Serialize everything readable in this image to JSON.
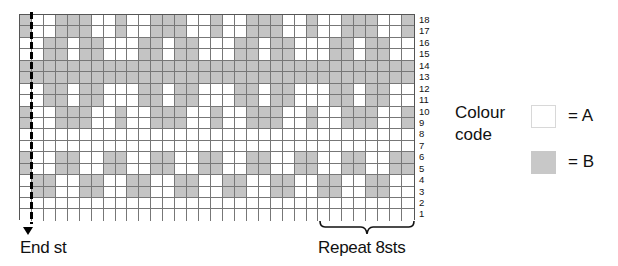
{
  "chart_data": {
    "type": "table",
    "columns": 33,
    "rows_count": 18,
    "colors": {
      "A": "#ffffff",
      "B": "#c4c4c4"
    },
    "rows": [
      {
        "row": 18,
        "cells": "BAABBBAABAABBBAABAABBBAABAABBBAAB"
      },
      {
        "row": 17,
        "cells": "BAABBBAABAABBBAABAABBBAABAABBBAAB"
      },
      {
        "row": 16,
        "cells": "AABBABBAAABBABBAAABBABBAAABBABBAA"
      },
      {
        "row": 15,
        "cells": "AABBABBAAABBABBAAABBABBAAABBABBAA"
      },
      {
        "row": 14,
        "cells": "BBBBBBBBBBBBBBBBBBBBBBBBBBBBBBBBB"
      },
      {
        "row": 13,
        "cells": "BBBBBBBBBBBBBBBBBBBBBBBBBBBBBBBBB"
      },
      {
        "row": 12,
        "cells": "AABBABBAAABBABBAAABBABBAAABBABBAA"
      },
      {
        "row": 11,
        "cells": "AABBABBAAABBABBAAABBABBAAABBABBAA"
      },
      {
        "row": 10,
        "cells": "BAABBBAABAABBBAABAABBBAABAABBBAAB"
      },
      {
        "row": 9,
        "cells": "BAABBBAABAABBBAABAABBBAABAABBBAAB"
      },
      {
        "row": 8,
        "cells": "AAAAAAAAAAAAAAAAAAAAAAAAAAAAAAAAA"
      },
      {
        "row": 7,
        "cells": "AAAAAAAAAAAAAAAAAAAAAAAAAAAAAAAAA"
      },
      {
        "row": 6,
        "cells": "BAABBAABBAABBAABBAABBAABBAABBAABB"
      },
      {
        "row": 5,
        "cells": "BAABBAABBAABBAABBAABBAABBAABBAABB"
      },
      {
        "row": 4,
        "cells": "ABBAABBAABBAABBAABBAABBAABBAABBAA"
      },
      {
        "row": 3,
        "cells": "ABBAABBAABBAABBAABBAABBAABBAABBAA"
      },
      {
        "row": 2,
        "cells": "AAAAAAAAAAAAAAAAAAAAAAAAAAAAAAAAA"
      },
      {
        "row": 1,
        "cells": "AAAAAAAAAAAAAAAAAAAAAAAAAAAAAAAAA"
      }
    ],
    "row_labels": [
      "18",
      "17",
      "16",
      "15",
      "14",
      "13",
      "12",
      "11",
      "10",
      "9",
      "8",
      "7",
      "6",
      "5",
      "4",
      "3",
      "2",
      "1"
    ],
    "annotations": {
      "end_stitch": "End st",
      "repeat": "Repeat 8sts",
      "repeat_columns": [
        26,
        33
      ]
    }
  },
  "labels": {
    "end_st": "End st",
    "repeat": "Repeat 8sts"
  },
  "legend": {
    "title": "Colour code",
    "items": [
      {
        "key": "A",
        "label": "= A",
        "color": "#ffffff"
      },
      {
        "key": "B",
        "label": "= B",
        "color": "#c4c4c4"
      }
    ]
  }
}
